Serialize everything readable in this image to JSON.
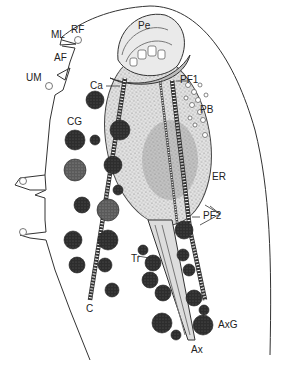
{
  "figure": {
    "type": "cell-diagram",
    "labels": {
      "ML": "ML",
      "RF": "RF",
      "AF": "AF",
      "UM": "UM",
      "Pe": "Pe",
      "Ca": "Ca",
      "PF1": "PF1",
      "PB": "PB",
      "CG": "CG",
      "ER": "ER",
      "PF2": "PF2",
      "Tr": "Tr",
      "C": "C",
      "AxG": "AxG",
      "Ax": "Ax"
    },
    "colors": {
      "outline": "#333333",
      "granule_dark": "#2a2a2a",
      "granule_light": "#6e6e6e",
      "nucleus_fill": "#d9d9d9",
      "background": "#ffffff"
    }
  }
}
